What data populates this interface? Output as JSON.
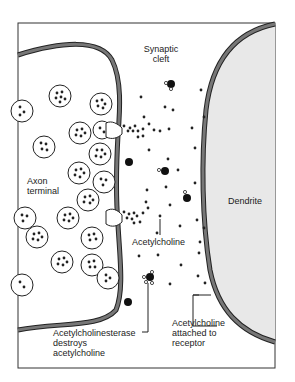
{
  "diagram": {
    "type": "synapse-illustration",
    "labels": {
      "synaptic_cleft_1": "Synaptic",
      "synaptic_cleft_2": "cleft",
      "axon_1": "Axon",
      "axon_2": "terminal",
      "dendrite": "Dendrite",
      "acetylcholine": "Acetylcholine",
      "enzyme_1": "Acetylcholinesterase",
      "enzyme_2": "destroys",
      "enzyme_3": "acetylcholine",
      "receptor_1": "Acetylcholine",
      "receptor_2": "attached to",
      "receptor_3": "receptor"
    },
    "colors": {
      "membrane": "#707070",
      "outline": "#222222",
      "dendrite_fill": "#e8e8e8",
      "background": "#ffffff"
    }
  }
}
